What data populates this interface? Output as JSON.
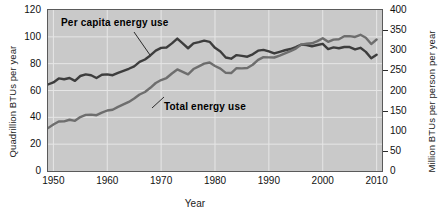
{
  "chart_data": {
    "type": "line",
    "title": "",
    "xlabel": "Year",
    "ylabel": "Quadrillion BTUs per year",
    "ylabel_right": "Million BTUs per person per year",
    "xlim": [
      1949,
      2011
    ],
    "ylim": [
      0,
      120
    ],
    "ylim_right": [
      0,
      400
    ],
    "grid": true,
    "legend_position": "inline-annotations",
    "xticks": [
      "1950",
      "1960",
      "1970",
      "1980",
      "1990",
      "2000",
      "2010"
    ],
    "xtick_values": [
      1950,
      1960,
      1970,
      1980,
      1990,
      2000,
      2010
    ],
    "yticks_left": [
      "0",
      "20",
      "40",
      "60",
      "80",
      "100",
      "120"
    ],
    "ytick_values_left": [
      0,
      20,
      40,
      60,
      80,
      100,
      120
    ],
    "yticks_right": [
      "0",
      "50",
      "100",
      "150",
      "200",
      "250",
      "300",
      "350",
      "400"
    ],
    "ytick_values_right": [
      0,
      50,
      100,
      150,
      200,
      250,
      300,
      350,
      400
    ],
    "series": [
      {
        "name": "Per capita energy use",
        "axis": "right",
        "units": "Million BTUs per person per year",
        "color": "#3d3d3d",
        "x": [
          1949,
          1950,
          1951,
          1952,
          1953,
          1954,
          1955,
          1956,
          1957,
          1958,
          1959,
          1960,
          1961,
          1962,
          1963,
          1964,
          1965,
          1966,
          1967,
          1968,
          1969,
          1970,
          1971,
          1972,
          1973,
          1974,
          1975,
          1976,
          1977,
          1978,
          1979,
          1980,
          1981,
          1982,
          1983,
          1984,
          1985,
          1986,
          1987,
          1988,
          1989,
          1990,
          1991,
          1992,
          1993,
          1994,
          1995,
          1996,
          1997,
          1998,
          1999,
          2000,
          2001,
          2002,
          2003,
          2004,
          2005,
          2006,
          2007,
          2008,
          2009,
          2010
        ],
        "values": [
          215,
          220,
          230,
          228,
          231,
          224,
          236,
          240,
          238,
          231,
          239,
          240,
          238,
          244,
          249,
          254,
          260,
          271,
          277,
          287,
          299,
          306,
          307,
          317,
          329,
          317,
          305,
          317,
          320,
          324,
          321,
          306,
          297,
          282,
          279,
          288,
          286,
          284,
          290,
          299,
          301,
          297,
          292,
          296,
          300,
          303,
          308,
          314,
          313,
          310,
          313,
          316,
          303,
          307,
          305,
          308,
          308,
          302,
          306,
          296,
          280,
          289
        ]
      },
      {
        "name": "Total energy use",
        "axis": "left",
        "units": "Quadrillion BTUs per year",
        "color": "#6e6e6e",
        "x": [
          1949,
          1950,
          1951,
          1952,
          1953,
          1954,
          1955,
          1956,
          1957,
          1958,
          1959,
          1960,
          1961,
          1962,
          1963,
          1964,
          1965,
          1966,
          1967,
          1968,
          1969,
          1970,
          1971,
          1972,
          1973,
          1974,
          1975,
          1976,
          1977,
          1978,
          1979,
          1980,
          1981,
          1982,
          1983,
          1984,
          1985,
          1986,
          1987,
          1988,
          1989,
          1990,
          1991,
          1992,
          1993,
          1994,
          1995,
          1996,
          1997,
          1998,
          1999,
          2000,
          2001,
          2002,
          2003,
          2004,
          2005,
          2006,
          2007,
          2008,
          2009,
          2010
        ],
        "values": [
          32.0,
          34.6,
          36.9,
          37.0,
          38.2,
          37.4,
          40.2,
          41.8,
          42.0,
          41.6,
          43.5,
          45.1,
          45.7,
          47.8,
          49.6,
          51.5,
          54.0,
          57.0,
          58.9,
          62.0,
          65.6,
          67.8,
          69.3,
          72.7,
          75.7,
          73.9,
          72.0,
          76.0,
          78.0,
          80.0,
          80.9,
          78.3,
          76.3,
          73.1,
          73.0,
          76.7,
          76.5,
          76.8,
          79.2,
          82.8,
          84.9,
          84.7,
          84.6,
          86.0,
          87.6,
          89.3,
          91.2,
          94.2,
          94.8,
          95.2,
          96.8,
          99.0,
          96.3,
          97.9,
          98.2,
          100.4,
          100.5,
          99.9,
          101.5,
          99.3,
          94.6,
          98.0
        ]
      }
    ],
    "annotations": [
      {
        "text": "Per capita energy use",
        "leader": true
      },
      {
        "text": "Total energy use",
        "leader": true
      }
    ]
  },
  "colors": {
    "plot_background": "#c9c9c9",
    "gridline": "#e6e6e6",
    "axis": "#5a5a5a",
    "per_capita": "#3d3d3d",
    "total": "#6e6e6e"
  }
}
